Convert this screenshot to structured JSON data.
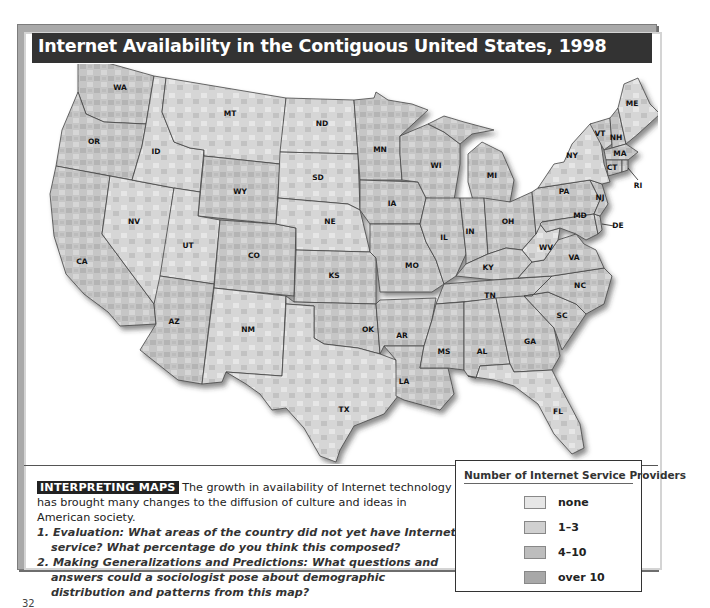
{
  "title": "Internet Availability in the Contiguous United States, 1998",
  "map": {
    "region": "Contiguous United States",
    "state_labels": [
      "WA",
      "OR",
      "CA",
      "ID",
      "NV",
      "MT",
      "WY",
      "UT",
      "AZ",
      "CO",
      "NM",
      "ND",
      "SD",
      "NE",
      "KS",
      "OK",
      "TX",
      "MN",
      "IA",
      "MO",
      "AR",
      "LA",
      "WI",
      "IL",
      "MI",
      "IN",
      "OH",
      "KY",
      "TN",
      "MS",
      "AL",
      "GA",
      "FL",
      "SC",
      "NC",
      "VA",
      "WV",
      "PA",
      "NY",
      "MD",
      "DE",
      "NJ",
      "CT",
      "RI",
      "MA",
      "VT",
      "NH",
      "ME"
    ]
  },
  "legend": {
    "title": "Number of Internet Service Providers",
    "items": [
      {
        "label": "none",
        "color": "#e6e6e6"
      },
      {
        "label": "1–3",
        "color": "#d0d0d0"
      },
      {
        "label": "4–10",
        "color": "#bdbdbd"
      },
      {
        "label": "over 10",
        "color": "#a8a8a8"
      }
    ]
  },
  "caption": {
    "tag": "INTERPRETING MAPS",
    "intro": "The growth in availability of Internet technology has brought many changes to the diffusion of culture and ideas in American society.",
    "questions": [
      "1. Evaluation: What areas of the country did not yet have Internet service? What percentage do you think this composed?",
      "2. Making Generalizations and Predictions: What questions and answers could a sociologist pose about demographic distribution and patterns from this map?"
    ]
  },
  "page_fragment": "32"
}
